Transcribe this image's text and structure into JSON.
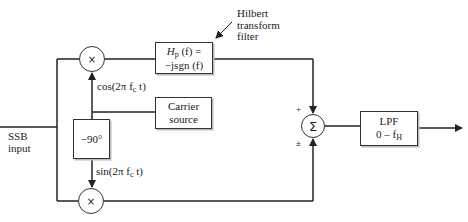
{
  "diagram": {
    "input_label": [
      "SSB",
      "input"
    ],
    "annotation": [
      "Hilbert",
      "transform",
      "filter"
    ],
    "blocks": {
      "hilbert": {
        "line1_prefix": "H",
        "line1_sub": "p",
        "line1_suffix": "(f) =",
        "line2": "−jsgn (f)"
      },
      "carrier": {
        "line1": "Carrier",
        "line2": "source"
      },
      "phase_shift": {
        "label": "−90°"
      },
      "lpf": {
        "line1": "LPF",
        "line2_prefix": "0 – f",
        "line2_sub": "H"
      }
    },
    "nodes": {
      "mult_top": "×",
      "mult_bottom": "×",
      "summer": "Σ"
    },
    "signals": {
      "cos_label": "cos(2π f",
      "cos_sub": "c",
      "cos_tail": " t)",
      "sin_label": "sin(2π f",
      "sin_sub": "c",
      "sin_tail": " t)"
    },
    "summer_signs": {
      "top": "+",
      "bottom": "±"
    },
    "colors": {
      "line": "#222222",
      "box_border": "#333333",
      "shadow": "#bbbbbb",
      "background": "#ffffff"
    }
  }
}
